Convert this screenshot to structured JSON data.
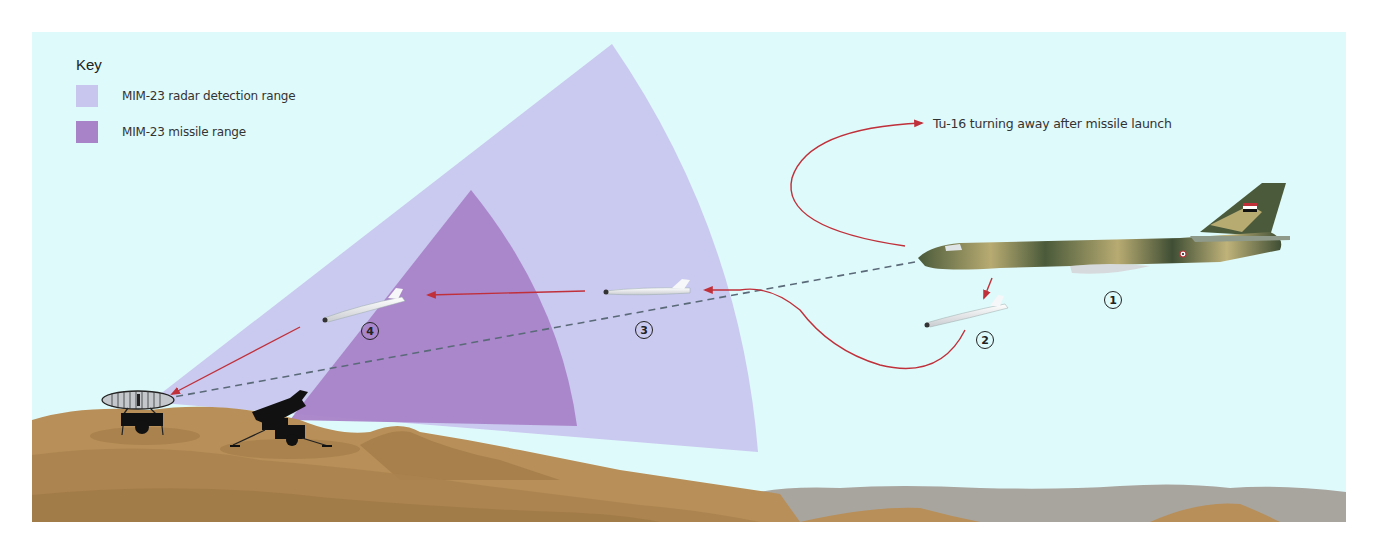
{
  "key": {
    "title": "Key",
    "items": [
      {
        "label": "MIM-23 radar detection range",
        "color": "#c8c6ee"
      },
      {
        "label": "MIM-23 missile range",
        "color": "#a883c8"
      }
    ]
  },
  "annotations": {
    "turn_away": "Tu-16 turning away after missile launch"
  },
  "markers": [
    {
      "label": "1",
      "target": "Tu-16 bomber"
    },
    {
      "label": "2",
      "target": "missile released"
    },
    {
      "label": "3",
      "target": "missile in radar range"
    },
    {
      "label": "4",
      "target": "missile in missile range"
    }
  ],
  "colors": {
    "sky": "#dffafb",
    "radar_range": "#c8c6ee",
    "missile_range": "#a883c8",
    "sand": "#b88f58",
    "sand_dark": "#9d7745",
    "rock_grey": "#a8a49e",
    "path_red": "#c0303a",
    "radar_line": "#5a6a78"
  }
}
